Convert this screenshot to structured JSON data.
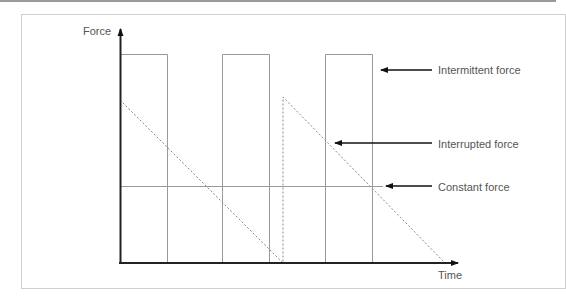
{
  "diagram": {
    "y_axis_label": "Force",
    "x_axis_label": "Time",
    "labels": {
      "intermittent": "Intermittent force",
      "interrupted": "Interrupted force",
      "constant": "Constant force"
    },
    "colors": {
      "axis": "#222222",
      "thin_line": "#999999",
      "dashed": "#888888",
      "arrow": "#111111",
      "text": "#555555",
      "frame": "#cfcfcf",
      "top_bar": "#9a9a9a"
    },
    "series": [
      {
        "name": "Intermittent force",
        "style": "solid rectangles",
        "pulses": [
          {
            "start": 0.0,
            "end": 0.14
          },
          {
            "start": 0.3,
            "end": 0.44
          },
          {
            "start": 0.61,
            "end": 0.75
          }
        ],
        "level": 0.9
      },
      {
        "name": "Interrupted force",
        "style": "dashed sawtooth",
        "points": [
          [
            0.0,
            0.7
          ],
          [
            0.48,
            0.0
          ],
          [
            0.48,
            0.71
          ],
          [
            0.96,
            0.0
          ]
        ]
      },
      {
        "name": "Constant force",
        "style": "solid horizontal line",
        "level": 0.33
      }
    ]
  }
}
